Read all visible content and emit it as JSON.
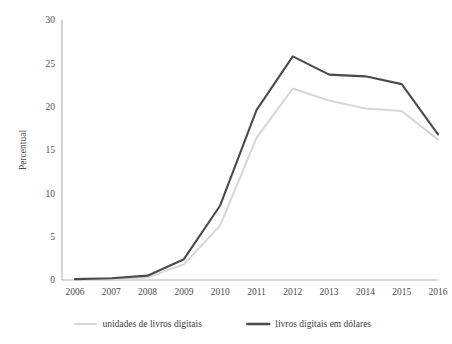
{
  "chart_data": {
    "type": "line",
    "title": "",
    "subtitle": "",
    "xlabel": "",
    "ylabel": "Percentual",
    "categories": [
      "2006",
      "2007",
      "2008",
      "2009",
      "2010",
      "2011",
      "2012",
      "2013",
      "2014",
      "2015",
      "2016"
    ],
    "x": [
      2006,
      2007,
      2008,
      2009,
      2010,
      2011,
      2012,
      2013,
      2014,
      2015,
      2016
    ],
    "series": [
      {
        "name": "unidades de livros digitais",
        "color": "#d6d6d6",
        "values": [
          0.1,
          0.1,
          0.3,
          1.8,
          6.3,
          16.4,
          22.1,
          20.7,
          19.8,
          19.5,
          16.2
        ]
      },
      {
        "name": "livros digitais em dólares",
        "color": "#4a4a52",
        "values": [
          0.1,
          0.2,
          0.5,
          2.4,
          8.6,
          19.6,
          25.8,
          23.7,
          23.5,
          22.6,
          16.8
        ]
      }
    ],
    "ylim": [
      0,
      30
    ],
    "yticks": [
      0,
      5,
      10,
      15,
      20,
      25,
      30
    ],
    "ytick_labels": [
      "0",
      "5",
      "10",
      "15",
      "20",
      "25",
      "30"
    ],
    "grid": false,
    "legend_position": "bottom",
    "axis_color": "#b0b0b0"
  },
  "legend": {
    "entries": [
      {
        "label": "unidades de livros digitais",
        "color": "#d6d6d6"
      },
      {
        "label": "livros digitais em dólares",
        "color": "#4a4a52"
      }
    ]
  }
}
